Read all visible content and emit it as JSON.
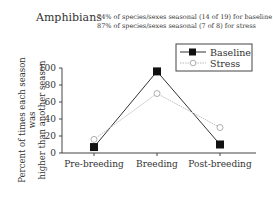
{
  "chart_data": {
    "type": "line",
    "title": "Amphibians",
    "annotations": [
      "74% of species/sexes seasonal (14 of 19) for baseline",
      "87% of species/sexes seasonal (7 of 8) for stress"
    ],
    "xlabel": "",
    "ylabel": "Percent of times each season was higher than another season",
    "ylabel_lines": [
      "Percent of times each season was",
      "higher than another season"
    ],
    "categories": [
      "Pre-breeding",
      "Breeding",
      "Post-breeding"
    ],
    "series": [
      {
        "name": "Baseline",
        "values": [
          7,
          96,
          10
        ],
        "marker": "filled-square",
        "line": "solid",
        "color": "#333333"
      },
      {
        "name": "Stress",
        "values": [
          16,
          70,
          30
        ],
        "marker": "open-circle",
        "line": "dotted",
        "color": "#bbbbbb"
      }
    ],
    "ylim": [
      0,
      100
    ],
    "yticks": [
      0,
      20,
      40,
      60,
      80,
      100
    ],
    "grid": false,
    "legend_position": "upper right"
  }
}
